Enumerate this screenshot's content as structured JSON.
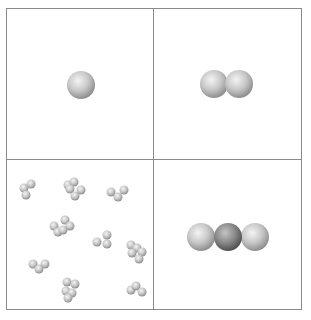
{
  "figure": {
    "panels": [
      {
        "id": "top-left",
        "content": "single atom",
        "atoms": 1,
        "arrangement": "single"
      },
      {
        "id": "top-right",
        "content": "diatomic molecule",
        "atoms": 2,
        "arrangement": "linear"
      },
      {
        "id": "bottom-left",
        "content": "many small molecules",
        "molecule_count": 9
      },
      {
        "id": "bottom-right",
        "content": "triatomic linear molecule",
        "atoms": 3,
        "arrangement": "linear",
        "center_atom": "darker"
      }
    ],
    "colors": {
      "border": "#8a8a8a",
      "atom_light": "#d4d4d4",
      "atom_dark": "#8c8c8c",
      "background": "#ffffff"
    }
  }
}
